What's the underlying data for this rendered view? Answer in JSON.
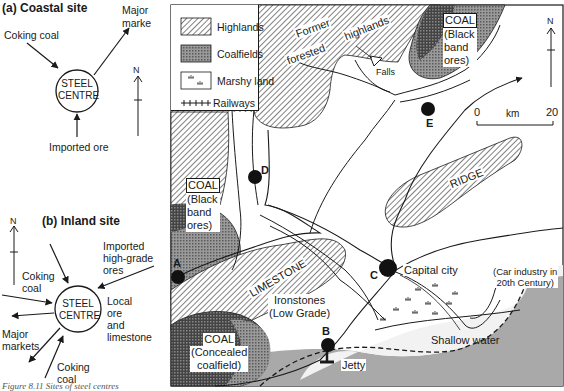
{
  "coastal_panel": {
    "title": "(a) Coastal site",
    "centre_label_line1": "STEEL",
    "centre_label_line2": "CENTRE",
    "inputs": [
      "Coking coal",
      "Imported ore"
    ],
    "outputs": [
      "Major marke"
    ],
    "north_label": "N"
  },
  "inland_panel": {
    "title": "(b) Inland site",
    "centre_label_line1": "STEEL",
    "centre_label_line2": "CENTRE",
    "coking_coal_top_line1": "Coking",
    "coking_coal_top_line2": "coal",
    "imported_line1": "Imported",
    "imported_line2": "high-grade",
    "imported_line3": "ores",
    "local_line1": "Local",
    "local_line2": "ore",
    "local_line3": "and",
    "local_line4": "limestone",
    "markets_line1": "Major",
    "markets_line2": "markets",
    "coking_coal_bottom_line1": "Coking",
    "coking_coal_bottom_line2": "coal",
    "north_label": "N"
  },
  "caption": "Figure 8.11   Sites of steel centres",
  "legend": {
    "items": [
      {
        "label": "Highlands",
        "pattern": "diagonal-hatch"
      },
      {
        "label": "Coalfields",
        "pattern": "crosshatch-grey"
      },
      {
        "label": "Marshy land",
        "pattern": "marsh-tufts"
      },
      {
        "label": "Railways",
        "pattern": "railway-line"
      }
    ]
  },
  "map": {
    "labels": {
      "former": "Former",
      "forested": "forested",
      "highlands": "highlands",
      "falls": "Falls",
      "coal_ne_title": "COAL",
      "coal_ne_line1": "(Black",
      "coal_ne_line2": "band",
      "coal_ne_line3": "ores)",
      "coal_w_title": "COAL",
      "coal_w_line1": "(Black",
      "coal_w_line2": "band",
      "coal_w_line3": "ores)",
      "coal_sw_title": "COAL",
      "coal_sw_line1": "(Concealed",
      "coal_sw_line2": "coalfield)",
      "ridge": "RIDGE",
      "limestone": "LIMESTONE",
      "ironstones_line1": "Ironstones",
      "ironstones_line2": "(Low Grade)",
      "capital": "Capital city",
      "car_line1": "(Car industry in",
      "car_line2": "20th Century)",
      "shallow_water": "Shallow water",
      "jetty": "Jetty"
    },
    "sites": [
      {
        "id": "A"
      },
      {
        "id": "B"
      },
      {
        "id": "C"
      },
      {
        "id": "D"
      },
      {
        "id": "E"
      }
    ],
    "scale": {
      "start": "0",
      "unit": "km",
      "end": "20"
    },
    "north_label": "N"
  },
  "colors": {
    "sea": "#a9a9a9",
    "shallow": "#f2f2f2",
    "coal": "#8c8c8c",
    "ink": "#1a1a1a"
  }
}
